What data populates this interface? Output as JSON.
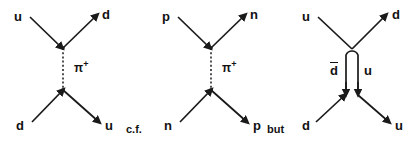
{
  "figure": {
    "caption_between": "c.f.",
    "caption_after": "but",
    "background_color": "#ffffff",
    "line_color": "#1a1a1a"
  },
  "diagrams": [
    {
      "id": "quark-level-pion-exchange",
      "labels": {
        "top_left": "u",
        "top_right": "d",
        "bottom_left": "d",
        "bottom_right": "u",
        "propagator": "π",
        "propagator_charge": "+"
      },
      "propagator_style": "dashed"
    },
    {
      "id": "nucleon-level-pion-exchange",
      "labels": {
        "top_left": "p",
        "top_right": "n",
        "bottom_left": "n",
        "bottom_right": "p",
        "propagator": "π",
        "propagator_charge": "+"
      },
      "propagator_style": "dashed"
    },
    {
      "id": "quark-line-loop-exchange",
      "labels": {
        "top_left": "u",
        "top_right": "d",
        "bottom_left": "d",
        "bottom_right": "u",
        "internal_left": "d",
        "internal_left_bar": true,
        "internal_right": "u"
      },
      "propagator_style": "solid-loop"
    }
  ]
}
